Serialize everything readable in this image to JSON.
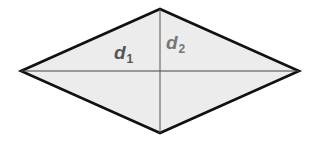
{
  "figure": {
    "shape": "rhombus",
    "fill_color": "#ececec",
    "outline_color": "#111111",
    "diagonal_color": "#444444",
    "vertices": {
      "left": [
        21,
        71
      ],
      "top": [
        160,
        9
      ],
      "right": [
        299,
        71
      ],
      "bottom": [
        160,
        133
      ]
    }
  },
  "labels": {
    "d1": {
      "main": "d",
      "sub": "1",
      "color": "#555555"
    },
    "d2": {
      "main": "d",
      "sub": "2",
      "color": "#777777"
    }
  }
}
